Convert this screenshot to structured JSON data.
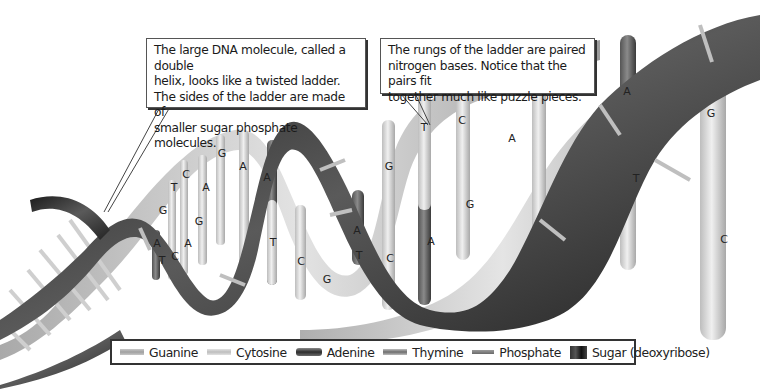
{
  "diagram": {
    "colors": {
      "background": "#ffffff",
      "sugar_backbone": "#2a2a2a",
      "phosphate": "#a8a8a8",
      "guanine": "#c2c2c2",
      "cytosine": "#d6d6d6",
      "adenine": "#555555",
      "thymine": "#9a9a9a"
    }
  },
  "callouts": [
    {
      "lines": [
        "The large DNA molecule, called a double",
        "helix, looks like a twisted ladder.",
        "The sides of the ladder are made of",
        "smaller sugar phosphate molecules."
      ]
    },
    {
      "lines": [
        "The rungs of the ladder are paired",
        "nitrogen bases. Notice that the pairs fit",
        "together much like puzzle pieces."
      ]
    }
  ],
  "base_labels": [
    {
      "text": "G",
      "x": 538,
      "y": 84
    },
    {
      "text": "A",
      "x": 627,
      "y": 95
    },
    {
      "text": "G",
      "x": 711,
      "y": 117
    },
    {
      "text": "C",
      "x": 462,
      "y": 124
    },
    {
      "text": "T",
      "x": 424,
      "y": 131
    },
    {
      "text": "A",
      "x": 512,
      "y": 142
    },
    {
      "text": "T",
      "x": 636,
      "y": 182
    },
    {
      "text": "G",
      "x": 470,
      "y": 208
    },
    {
      "text": "C",
      "x": 724,
      "y": 243
    },
    {
      "text": "A",
      "x": 431,
      "y": 245
    },
    {
      "text": "G",
      "x": 389,
      "y": 170
    },
    {
      "text": "A",
      "x": 357,
      "y": 234
    },
    {
      "text": "T",
      "x": 359,
      "y": 259
    },
    {
      "text": "C",
      "x": 390,
      "y": 262
    },
    {
      "text": "G",
      "x": 327,
      "y": 283
    },
    {
      "text": "C",
      "x": 301,
      "y": 265
    },
    {
      "text": "T",
      "x": 273,
      "y": 246
    },
    {
      "text": "A",
      "x": 243,
      "y": 170
    },
    {
      "text": "A",
      "x": 267,
      "y": 181
    },
    {
      "text": "G",
      "x": 222,
      "y": 157
    },
    {
      "text": "C",
      "x": 186,
      "y": 178
    },
    {
      "text": "A",
      "x": 206,
      "y": 191
    },
    {
      "text": "T",
      "x": 174,
      "y": 191
    },
    {
      "text": "G",
      "x": 163,
      "y": 214
    },
    {
      "text": "G",
      "x": 199,
      "y": 225
    },
    {
      "text": "A",
      "x": 157,
      "y": 247
    },
    {
      "text": "A",
      "x": 188,
      "y": 247
    },
    {
      "text": "T",
      "x": 162,
      "y": 264
    },
    {
      "text": "C",
      "x": 175,
      "y": 260
    }
  ],
  "legend": {
    "items": [
      {
        "key": "guanine",
        "label": "Guanine"
      },
      {
        "key": "cytosine",
        "label": "Cytosine"
      },
      {
        "key": "adenine",
        "label": "Adenine"
      },
      {
        "key": "thymine",
        "label": "Thymine"
      },
      {
        "key": "phosphate",
        "label": "Phosphate"
      },
      {
        "key": "sugar",
        "label": "Sugar (deoxyribose)"
      }
    ]
  }
}
